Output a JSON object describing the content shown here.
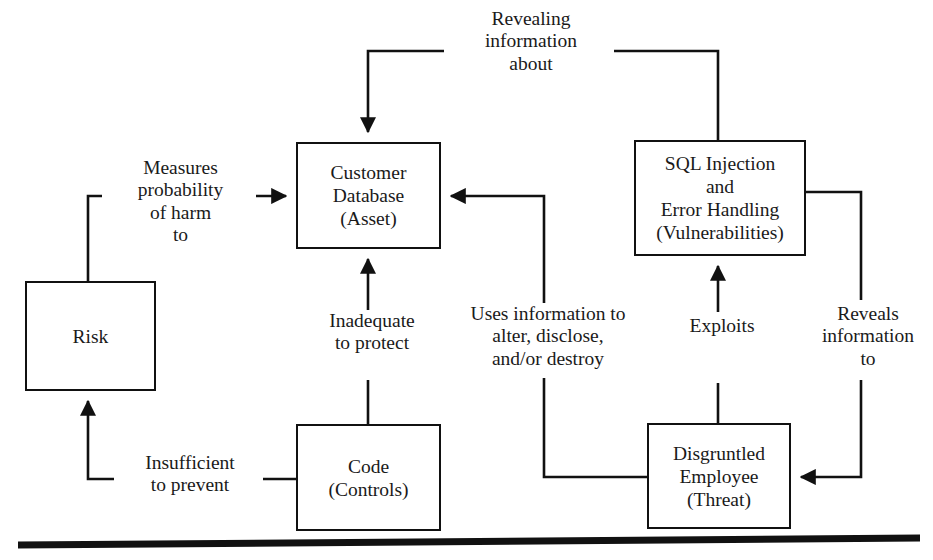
{
  "diagram": {
    "line_color": "#111111",
    "background": "#ffffff",
    "nodes": [
      {
        "id": "customer-database",
        "label": "Customer\nDatabase\n(Asset)",
        "x": 296,
        "y": 142,
        "w": 145,
        "h": 107
      },
      {
        "id": "sql-injection",
        "label": "SQL Injection\nand\nError Handling\n(Vulnerabilities)",
        "x": 634,
        "y": 140,
        "w": 172,
        "h": 116
      },
      {
        "id": "risk",
        "label": "Risk",
        "x": 25,
        "y": 281,
        "w": 131,
        "h": 110
      },
      {
        "id": "code",
        "label": "Code\n(Controls)",
        "x": 296,
        "y": 424,
        "w": 145,
        "h": 107
      },
      {
        "id": "disgruntled-employee",
        "label": "Disgruntled\nEmployee\n(Threat)",
        "x": 647,
        "y": 423,
        "w": 144,
        "h": 106
      }
    ],
    "edge_labels": [
      {
        "id": "revealing-information-about",
        "text": "Revealing\ninformation\nabout",
        "x": 448,
        "y": 8,
        "w": 160
      },
      {
        "id": "measures-probability-of-harm-to",
        "text": "Measures\nprobability\nof harm\nto",
        "x": 105,
        "y": 157,
        "w": 145
      },
      {
        "id": "inadequate-to-protect",
        "text": "Inadequate\nto protect",
        "x": 300,
        "y": 310,
        "w": 138
      },
      {
        "id": "uses-information-to-alter-disclose-destroy",
        "text": "Uses information to\nalter, disclose,\nand/or destroy",
        "x": 454,
        "y": 303,
        "w": 182
      },
      {
        "id": "exploits",
        "text": "Exploits",
        "x": 669,
        "y": 315,
        "w": 100
      },
      {
        "id": "reveals-information-to",
        "text": "Reveals\ninformation\nto",
        "x": 805,
        "y": 303,
        "w": 124
      },
      {
        "id": "insufficient-to-prevent",
        "text": "Insufficient\nto prevent",
        "x": 117,
        "y": 452,
        "w": 140
      }
    ],
    "edges": [
      {
        "id": "sql-to-customer-database",
        "from": "sql-injection",
        "to": "customer-database",
        "label": "Revealing information about"
      },
      {
        "id": "risk-to-customer-database",
        "from": "risk",
        "to": "customer-database",
        "label": "Measures probability of harm to"
      },
      {
        "id": "code-to-customer-database",
        "from": "code",
        "to": "customer-database",
        "label": "Inadequate to protect"
      },
      {
        "id": "employee-to-customer-database",
        "from": "disgruntled-employee",
        "to": "customer-database",
        "label": "Uses information to alter, disclose, and/or destroy"
      },
      {
        "id": "employee-to-sql",
        "from": "disgruntled-employee",
        "to": "sql-injection",
        "label": "Exploits"
      },
      {
        "id": "sql-to-employee",
        "from": "sql-injection",
        "to": "disgruntled-employee",
        "label": "Reveals information to"
      },
      {
        "id": "code-to-risk",
        "from": "code",
        "to": "risk",
        "label": "Insufficient to prevent"
      }
    ],
    "footer_rule": {
      "id": "bottom-rule",
      "present": true
    }
  }
}
